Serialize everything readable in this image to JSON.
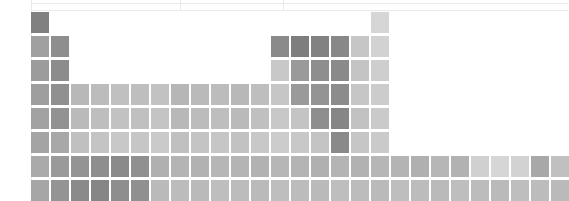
{
  "chart_data": {
    "type": "heatmap",
    "title": "",
    "subtitle": "",
    "xlabel": "",
    "ylabel": "",
    "grid": false,
    "legend": null,
    "layout": {
      "shape": "periodic-table",
      "columns": 18,
      "rows": 8,
      "cell_width": 18,
      "cell_height": 21,
      "gap_x": 2,
      "gap_y": 3,
      "origin_x": 31,
      "origin_y": 12,
      "colormap": "greys",
      "value_range": [
        0,
        1
      ],
      "note": "grayscale intensity: darker = higher value"
    },
    "rules": {
      "horizontal": [
        3,
        10
      ],
      "vertical": [
        31,
        180,
        283
      ],
      "color": "#e9e9e9"
    },
    "cells": [
      {
        "name": "H",
        "col": 1,
        "row": 1,
        "shade": "#808080",
        "value": 0.5
      },
      {
        "name": "He",
        "col": 18,
        "row": 1,
        "shade": "#d6d6d6",
        "value": 0.16
      },
      {
        "name": "Li",
        "col": 1,
        "row": 2,
        "shade": "#a0a0a0",
        "value": 0.37
      },
      {
        "name": "Be",
        "col": 2,
        "row": 2,
        "shade": "#8e8e8e",
        "value": 0.44
      },
      {
        "name": "B",
        "col": 13,
        "row": 2,
        "shade": "#8a8a8a",
        "value": 0.46
      },
      {
        "name": "C",
        "col": 14,
        "row": 2,
        "shade": "#7e7e7e",
        "value": 0.51
      },
      {
        "name": "N",
        "col": 15,
        "row": 2,
        "shade": "#828282",
        "value": 0.49
      },
      {
        "name": "O",
        "col": 16,
        "row": 2,
        "shade": "#888888",
        "value": 0.47
      },
      {
        "name": "F",
        "col": 17,
        "row": 2,
        "shade": "#c6c6c6",
        "value": 0.22
      },
      {
        "name": "Ne",
        "col": 18,
        "row": 2,
        "shade": "#d2d2d2",
        "value": 0.18
      },
      {
        "name": "Na",
        "col": 1,
        "row": 3,
        "shade": "#9c9c9c",
        "value": 0.39
      },
      {
        "name": "Mg",
        "col": 2,
        "row": 3,
        "shade": "#8c8c8c",
        "value": 0.45
      },
      {
        "name": "Al",
        "col": 13,
        "row": 3,
        "shade": "#c8c8c8",
        "value": 0.21
      },
      {
        "name": "Si",
        "col": 14,
        "row": 3,
        "shade": "#9a9a9a",
        "value": 0.4
      },
      {
        "name": "P",
        "col": 15,
        "row": 3,
        "shade": "#8e8e8e",
        "value": 0.44
      },
      {
        "name": "S",
        "col": 16,
        "row": 3,
        "shade": "#8a8a8a",
        "value": 0.46
      },
      {
        "name": "Cl",
        "col": 17,
        "row": 3,
        "shade": "#c4c4c4",
        "value": 0.23
      },
      {
        "name": "Ar",
        "col": 18,
        "row": 3,
        "shade": "#cecece",
        "value": 0.19
      },
      {
        "name": "K",
        "col": 1,
        "row": 4,
        "shade": "#9e9e9e",
        "value": 0.38
      },
      {
        "name": "Ca",
        "col": 2,
        "row": 4,
        "shade": "#909090",
        "value": 0.44
      },
      {
        "name": "Sc",
        "col": 3,
        "row": 4,
        "shade": "#b8b8b8",
        "value": 0.28
      },
      {
        "name": "Ti",
        "col": 4,
        "row": 4,
        "shade": "#bcbcbc",
        "value": 0.27
      },
      {
        "name": "V",
        "col": 5,
        "row": 4,
        "shade": "#c0c0c0",
        "value": 0.25
      },
      {
        "name": "Cr",
        "col": 6,
        "row": 4,
        "shade": "#bebebe",
        "value": 0.26
      },
      {
        "name": "Mn",
        "col": 7,
        "row": 4,
        "shade": "#c2c2c2",
        "value": 0.24
      },
      {
        "name": "Fe",
        "col": 8,
        "row": 4,
        "shade": "#b6b6b6",
        "value": 0.29
      },
      {
        "name": "Co",
        "col": 9,
        "row": 4,
        "shade": "#bababa",
        "value": 0.28
      },
      {
        "name": "Ni",
        "col": 10,
        "row": 4,
        "shade": "#bcbcbc",
        "value": 0.27
      },
      {
        "name": "Cu",
        "col": 11,
        "row": 4,
        "shade": "#b8b8b8",
        "value": 0.28
      },
      {
        "name": "Zn",
        "col": 12,
        "row": 4,
        "shade": "#bebebe",
        "value": 0.26
      },
      {
        "name": "Ga",
        "col": 13,
        "row": 4,
        "shade": "#c6c6c6",
        "value": 0.22
      },
      {
        "name": "Ge",
        "col": 14,
        "row": 4,
        "shade": "#9a9a9a",
        "value": 0.4
      },
      {
        "name": "As",
        "col": 15,
        "row": 4,
        "shade": "#949494",
        "value": 0.42
      },
      {
        "name": "Se",
        "col": 16,
        "row": 4,
        "shade": "#8c8c8c",
        "value": 0.45
      },
      {
        "name": "Br",
        "col": 17,
        "row": 4,
        "shade": "#c6c6c6",
        "value": 0.22
      },
      {
        "name": "Kr",
        "col": 18,
        "row": 4,
        "shade": "#cccccc",
        "value": 0.2
      },
      {
        "name": "Rb",
        "col": 1,
        "row": 5,
        "shade": "#a2a2a2",
        "value": 0.36
      },
      {
        "name": "Sr",
        "col": 2,
        "row": 5,
        "shade": "#929292",
        "value": 0.43
      },
      {
        "name": "Y",
        "col": 3,
        "row": 5,
        "shade": "#bababa",
        "value": 0.28
      },
      {
        "name": "Zr",
        "col": 4,
        "row": 5,
        "shade": "#bebebe",
        "value": 0.26
      },
      {
        "name": "Nb",
        "col": 5,
        "row": 5,
        "shade": "#c2c2c2",
        "value": 0.24
      },
      {
        "name": "Mo",
        "col": 6,
        "row": 5,
        "shade": "#c0c0c0",
        "value": 0.25
      },
      {
        "name": "Tc",
        "col": 7,
        "row": 5,
        "shade": "#c4c4c4",
        "value": 0.23
      },
      {
        "name": "Ru",
        "col": 8,
        "row": 5,
        "shade": "#b8b8b8",
        "value": 0.28
      },
      {
        "name": "Rh",
        "col": 9,
        "row": 5,
        "shade": "#bcbcbc",
        "value": 0.27
      },
      {
        "name": "Pd",
        "col": 10,
        "row": 5,
        "shade": "#bebebe",
        "value": 0.26
      },
      {
        "name": "Ag",
        "col": 11,
        "row": 5,
        "shade": "#bababa",
        "value": 0.28
      },
      {
        "name": "Cd",
        "col": 12,
        "row": 5,
        "shade": "#c0c0c0",
        "value": 0.25
      },
      {
        "name": "In",
        "col": 13,
        "row": 5,
        "shade": "#c8c8c8",
        "value": 0.21
      },
      {
        "name": "Sn",
        "col": 14,
        "row": 5,
        "shade": "#c4c4c4",
        "value": 0.23
      },
      {
        "name": "Sb",
        "col": 15,
        "row": 5,
        "shade": "#8e8e8e",
        "value": 0.44
      },
      {
        "name": "Te",
        "col": 16,
        "row": 5,
        "shade": "#868686",
        "value": 0.48
      },
      {
        "name": "I",
        "col": 17,
        "row": 5,
        "shade": "#c2c2c2",
        "value": 0.24
      },
      {
        "name": "Xe",
        "col": 18,
        "row": 5,
        "shade": "#cacaca",
        "value": 0.21
      },
      {
        "name": "Cs",
        "col": 1,
        "row": 6,
        "shade": "#a4a4a4",
        "value": 0.36
      },
      {
        "name": "Ba",
        "col": 2,
        "row": 6,
        "shade": "#a8a8a8",
        "value": 0.34
      },
      {
        "name": "La",
        "col": 3,
        "row": 6,
        "shade": "#c0c0c0",
        "value": 0.25
      },
      {
        "name": "Hf",
        "col": 4,
        "row": 6,
        "shade": "#c4c4c4",
        "value": 0.23
      },
      {
        "name": "Ta",
        "col": 5,
        "row": 6,
        "shade": "#c8c8c8",
        "value": 0.21
      },
      {
        "name": "W",
        "col": 6,
        "row": 6,
        "shade": "#c6c6c6",
        "value": 0.22
      },
      {
        "name": "Re",
        "col": 7,
        "row": 6,
        "shade": "#cacaca",
        "value": 0.21
      },
      {
        "name": "Os",
        "col": 8,
        "row": 6,
        "shade": "#c0c0c0",
        "value": 0.25
      },
      {
        "name": "Ir",
        "col": 9,
        "row": 6,
        "shade": "#c4c4c4",
        "value": 0.23
      },
      {
        "name": "Pt",
        "col": 10,
        "row": 6,
        "shade": "#c6c6c6",
        "value": 0.22
      },
      {
        "name": "Au",
        "col": 11,
        "row": 6,
        "shade": "#c2c2c2",
        "value": 0.24
      },
      {
        "name": "Hg",
        "col": 12,
        "row": 6,
        "shade": "#c8c8c8",
        "value": 0.21
      },
      {
        "name": "Tl",
        "col": 13,
        "row": 6,
        "shade": "#cccccc",
        "value": 0.2
      },
      {
        "name": "Pb",
        "col": 14,
        "row": 6,
        "shade": "#c8c8c8",
        "value": 0.21
      },
      {
        "name": "Bi",
        "col": 15,
        "row": 6,
        "shade": "#c4c4c4",
        "value": 0.23
      },
      {
        "name": "Po",
        "col": 16,
        "row": 6,
        "shade": "#8a8a8a",
        "value": 0.46
      },
      {
        "name": "At",
        "col": 17,
        "row": 6,
        "shade": "#c6c6c6",
        "value": 0.22
      },
      {
        "name": "Rn",
        "col": 18,
        "row": 6,
        "shade": "#cacaca",
        "value": 0.21
      },
      {
        "name": "Fr",
        "col": 1,
        "row": 7,
        "shade": "#aaaaaa",
        "value": 0.33
      },
      {
        "name": "Ra",
        "col": 2,
        "row": 7,
        "shade": "#9a9a9a",
        "value": 0.4
      },
      {
        "name": "Ac",
        "col": 3,
        "row": 7,
        "shade": "#949494",
        "value": 0.42
      },
      {
        "name": "Rf",
        "col": 4,
        "row": 7,
        "shade": "#8e8e8e",
        "value": 0.44
      },
      {
        "name": "Db",
        "col": 5,
        "row": 7,
        "shade": "#8a8a8a",
        "value": 0.46
      },
      {
        "name": "Sg",
        "col": 6,
        "row": 7,
        "shade": "#909090",
        "value": 0.44
      },
      {
        "name": "Bh",
        "col": 7,
        "row": 7,
        "shade": "#b0b0b0",
        "value": 0.31
      },
      {
        "name": "Hs",
        "col": 8,
        "row": 7,
        "shade": "#b4b4b4",
        "value": 0.3
      },
      {
        "name": "Mt",
        "col": 9,
        "row": 7,
        "shade": "#b2b2b2",
        "value": 0.3
      },
      {
        "name": "Ds",
        "col": 10,
        "row": 7,
        "shade": "#b6b6b6",
        "value": 0.29
      },
      {
        "name": "Rg",
        "col": 11,
        "row": 7,
        "shade": "#b4b4b4",
        "value": 0.3
      },
      {
        "name": "Cn",
        "col": 12,
        "row": 7,
        "shade": "#b2b2b2",
        "value": 0.3
      },
      {
        "name": "Nh",
        "col": 13,
        "row": 7,
        "shade": "#b6b6b6",
        "value": 0.29
      },
      {
        "name": "Fl",
        "col": 14,
        "row": 7,
        "shade": "#b4b4b4",
        "value": 0.3
      },
      {
        "name": "Mc",
        "col": 15,
        "row": 7,
        "shade": "#b0b0b0",
        "value": 0.31
      },
      {
        "name": "Lv",
        "col": 16,
        "row": 7,
        "shade": "#b4b4b4",
        "value": 0.3
      },
      {
        "name": "Ts",
        "col": 17,
        "row": 7,
        "shade": "#b2b2b2",
        "value": 0.3
      },
      {
        "name": "Og",
        "col": 18,
        "row": 7,
        "shade": "#b6b6b6",
        "value": 0.29
      },
      {
        "name": "Ce",
        "col": 1,
        "row": 8,
        "shade": "#a6a6a6",
        "value": 0.35
      },
      {
        "name": "Pr",
        "col": 2,
        "row": 8,
        "shade": "#949494",
        "value": 0.42
      },
      {
        "name": "Nd",
        "col": 3,
        "row": 8,
        "shade": "#8a8a8a",
        "value": 0.46
      },
      {
        "name": "Pm",
        "col": 4,
        "row": 8,
        "shade": "#868686",
        "value": 0.48
      },
      {
        "name": "Sm",
        "col": 5,
        "row": 8,
        "shade": "#8e8e8e",
        "value": 0.44
      },
      {
        "name": "Eu",
        "col": 6,
        "row": 8,
        "shade": "#909090",
        "value": 0.44
      },
      {
        "name": "Gd",
        "col": 7,
        "row": 8,
        "shade": "#bababa",
        "value": 0.28
      },
      {
        "name": "Tb",
        "col": 8,
        "row": 8,
        "shade": "#bcbcbc",
        "value": 0.27
      },
      {
        "name": "Dy",
        "col": 9,
        "row": 8,
        "shade": "#bababa",
        "value": 0.28
      },
      {
        "name": "Ho",
        "col": 10,
        "row": 8,
        "shade": "#bebebe",
        "value": 0.26
      },
      {
        "name": "Er",
        "col": 11,
        "row": 8,
        "shade": "#bcbcbc",
        "value": 0.27
      },
      {
        "name": "Tm",
        "col": 12,
        "row": 8,
        "shade": "#bababa",
        "value": 0.28
      },
      {
        "name": "Yb",
        "col": 13,
        "row": 8,
        "shade": "#bebebe",
        "value": 0.26
      },
      {
        "name": "Lu",
        "col": 14,
        "row": 8,
        "shade": "#bcbcbc",
        "value": 0.27
      },
      {
        "name": "Th",
        "col": 15,
        "row": 8,
        "shade": "#bababa",
        "value": 0.28
      },
      {
        "name": "Pa",
        "col": 16,
        "row": 8,
        "shade": "#bebebe",
        "value": 0.26
      },
      {
        "name": "U",
        "col": 17,
        "row": 8,
        "shade": "#bcbcbc",
        "value": 0.27
      },
      {
        "name": "Np",
        "col": 18,
        "row": 8,
        "shade": "#bababa",
        "value": 0.28
      },
      {
        "name": "Pu",
        "col": 19,
        "row": 8,
        "shade": "#bebebe",
        "value": 0.26
      },
      {
        "name": "Am",
        "col": 20,
        "row": 8,
        "shade": "#bcbcbc",
        "value": 0.27
      },
      {
        "name": "Cm",
        "col": 21,
        "row": 8,
        "shade": "#bababa",
        "value": 0.28
      },
      {
        "name": "Bk",
        "col": 22,
        "row": 8,
        "shade": "#bebebe",
        "value": 0.26
      },
      {
        "name": "Cf",
        "col": 23,
        "row": 8,
        "shade": "#bcbcbc",
        "value": 0.27
      },
      {
        "name": "Es",
        "col": 24,
        "row": 8,
        "shade": "#bababa",
        "value": 0.28
      },
      {
        "name": "Fm",
        "col": 25,
        "row": 8,
        "shade": "#bebebe",
        "value": 0.26
      },
      {
        "name": "Md",
        "col": 26,
        "row": 8,
        "shade": "#bcbcbc",
        "value": 0.27
      },
      {
        "name": "No",
        "col": 27,
        "row": 8,
        "shade": "#bababa",
        "value": 0.28
      },
      {
        "name": "Lr-ext-1",
        "col": 19,
        "row": 7,
        "shade": "#b4b4b4",
        "value": 0.3
      },
      {
        "name": "Lr-ext-2",
        "col": 20,
        "row": 7,
        "shade": "#b0b0b0",
        "value": 0.31
      },
      {
        "name": "Lr-ext-3",
        "col": 21,
        "row": 7,
        "shade": "#b6b6b6",
        "value": 0.29
      },
      {
        "name": "Lr-ext-4",
        "col": 22,
        "row": 7,
        "shade": "#b2b2b2",
        "value": 0.3
      },
      {
        "name": "Lr-ext-5",
        "col": 23,
        "row": 7,
        "shade": "#d0d0d0",
        "value": 0.19
      },
      {
        "name": "Lr-ext-6",
        "col": 24,
        "row": 7,
        "shade": "#d6d6d6",
        "value": 0.16
      },
      {
        "name": "Lr-ext-7",
        "col": 25,
        "row": 7,
        "shade": "#d2d2d2",
        "value": 0.18
      },
      {
        "name": "Lr-ext-8",
        "col": 26,
        "row": 7,
        "shade": "#a8a8a8",
        "value": 0.34
      },
      {
        "name": "Lr-ext-9",
        "col": 27,
        "row": 7,
        "shade": "#c0c0c0",
        "value": 0.25
      }
    ]
  }
}
